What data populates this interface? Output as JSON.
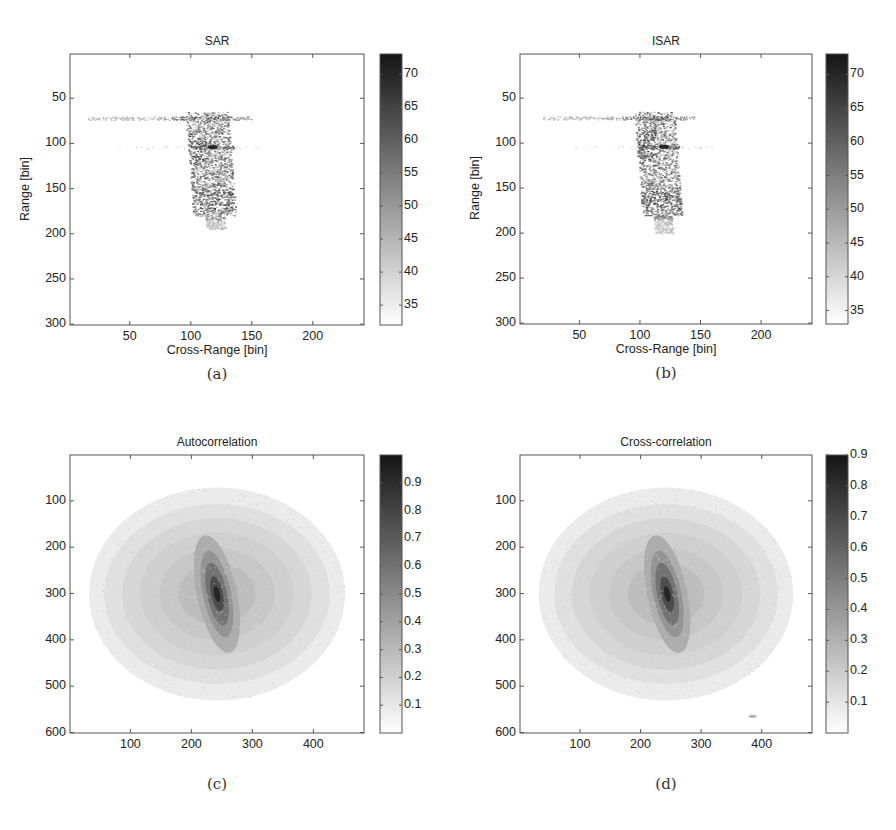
{
  "chart_data": [
    {
      "id": "a",
      "type": "heatmap",
      "title": "SAR",
      "caption": "(a)",
      "xlabel": "Cross-Range [bin]",
      "ylabel": "Range [bin]",
      "xlim": [
        1,
        242
      ],
      "ylim": [
        1,
        301
      ],
      "y_reversed": true,
      "xticks": [
        50,
        100,
        150,
        200
      ],
      "yticks": [
        50,
        100,
        150,
        200,
        250,
        300
      ],
      "colorbar": {
        "min": 32,
        "max": 73,
        "ticks": [
          35,
          40,
          45,
          50,
          55,
          60,
          65,
          70
        ]
      },
      "colormap": "gray-reversed",
      "features": {
        "horizontal_streak": {
          "y": 72,
          "x_range": [
            15,
            150
          ]
        },
        "secondary_streak": {
          "y": 104,
          "x_range": [
            100,
            135
          ]
        },
        "target_body": {
          "x_range": [
            95,
            130
          ],
          "y_range": [
            65,
            195
          ]
        },
        "hotspot": {
          "x": 118,
          "y": 104
        }
      }
    },
    {
      "id": "b",
      "type": "heatmap",
      "title": "ISAR",
      "caption": "(b)",
      "xlabel": "Cross-Range [bin]",
      "ylabel": "Range [bin]",
      "xlim": [
        1,
        242
      ],
      "ylim": [
        1,
        301
      ],
      "y_reversed": true,
      "xticks": [
        50,
        100,
        150,
        200
      ],
      "yticks": [
        50,
        100,
        150,
        200,
        250,
        300
      ],
      "colorbar": {
        "min": 33,
        "max": 73,
        "ticks": [
          35,
          40,
          45,
          50,
          55,
          60,
          65,
          70
        ]
      },
      "colormap": "gray-reversed",
      "features": {
        "horizontal_streak": {
          "y": 72,
          "x_range": [
            20,
            145
          ]
        },
        "secondary_streak": {
          "y": 104,
          "x_range": [
            100,
            132
          ]
        },
        "target_body": {
          "x_range": [
            95,
            128
          ],
          "y_range": [
            65,
            200
          ]
        },
        "hotspot": {
          "x": 120,
          "y": 104
        }
      }
    },
    {
      "id": "c",
      "type": "heatmap",
      "title": "Autocorrelation",
      "caption": "(c)",
      "xlabel": "",
      "ylabel": "",
      "xlim": [
        1,
        483
      ],
      "ylim": [
        1,
        601
      ],
      "y_reversed": true,
      "xticks": [
        100,
        200,
        300,
        400
      ],
      "yticks": [
        100,
        200,
        300,
        400,
        500,
        600
      ],
      "colorbar": {
        "min": 0,
        "max": 1.0,
        "ticks": [
          0.1,
          0.2,
          0.3,
          0.4,
          0.5,
          0.6,
          0.7,
          0.8,
          0.9
        ]
      },
      "colormap": "gray-reversed",
      "features": {
        "peak": {
          "x": 242,
          "y": 301,
          "value": 1.0
        },
        "support_center": {
          "x": 242,
          "y": 301
        },
        "support_radius_x": 210,
        "support_radius_y": 230
      }
    },
    {
      "id": "d",
      "type": "heatmap",
      "title": "Cross-correlation",
      "caption": "(d)",
      "xlabel": "",
      "ylabel": "",
      "xlim": [
        1,
        483
      ],
      "ylim": [
        1,
        601
      ],
      "y_reversed": true,
      "xticks": [
        100,
        200,
        300,
        400
      ],
      "yticks": [
        100,
        200,
        300,
        400,
        500,
        600
      ],
      "colorbar": {
        "min": 0,
        "max": 0.9,
        "ticks": [
          0.1,
          0.2,
          0.3,
          0.4,
          0.5,
          0.6,
          0.7,
          0.8,
          0.9
        ]
      },
      "colormap": "gray-reversed",
      "features": {
        "peak": {
          "x": 244,
          "y": 301,
          "value": 0.9
        },
        "support_center": {
          "x": 242,
          "y": 301
        },
        "support_radius_x": 210,
        "support_radius_y": 230
      }
    }
  ]
}
